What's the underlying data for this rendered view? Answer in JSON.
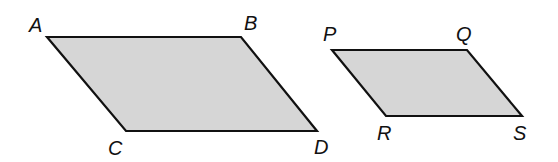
{
  "diagram": {
    "fill_color": "#d6d6d6",
    "stroke_color": "#111111",
    "shapes": [
      {
        "name": "parallelogram-ABCD",
        "vertices": [
          {
            "label": "A",
            "x": 47,
            "y": 37,
            "label_x": 29,
            "label_y": 32
          },
          {
            "label": "B",
            "x": 241,
            "y": 37,
            "label_x": 244,
            "label_y": 30
          },
          {
            "label": "D",
            "x": 317,
            "y": 131,
            "label_x": 314,
            "label_y": 154
          },
          {
            "label": "C",
            "x": 126,
            "y": 131,
            "label_x": 108,
            "label_y": 155
          }
        ]
      },
      {
        "name": "parallelogram-PQRS",
        "vertices": [
          {
            "label": "P",
            "x": 332,
            "y": 50,
            "label_x": 323,
            "label_y": 41
          },
          {
            "label": "Q",
            "x": 467,
            "y": 50,
            "label_x": 456,
            "label_y": 41
          },
          {
            "label": "S",
            "x": 522,
            "y": 116,
            "label_x": 513,
            "label_y": 140
          },
          {
            "label": "R",
            "x": 386,
            "y": 116,
            "label_x": 377,
            "label_y": 140
          }
        ]
      }
    ]
  }
}
